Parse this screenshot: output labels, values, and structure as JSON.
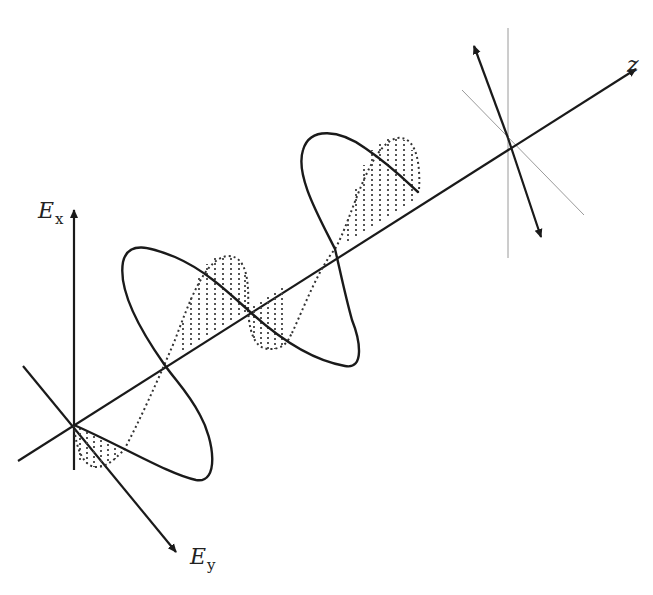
{
  "diagram": {
    "title": "",
    "type": "electromagnetic wave / circular polarization illustration",
    "labels": {
      "ex_main": "E",
      "ex_sub": "x",
      "ey_main": "E",
      "ey_sub": "y",
      "z": "z"
    },
    "colors": {
      "stroke": "#1a1a1a",
      "thin_guides": "#9a9a9a",
      "background": "#ffffff"
    },
    "elements": [
      "Ex vertical axis with arrow",
      "Ey diagonal axis with arrow",
      "z propagation axis with arrow",
      "solid wave curve (Ex component)",
      "dotted hatched wave curve (Ey component)",
      "double-headed resultant field vector at far end",
      "thin guide lines at far end"
    ]
  }
}
